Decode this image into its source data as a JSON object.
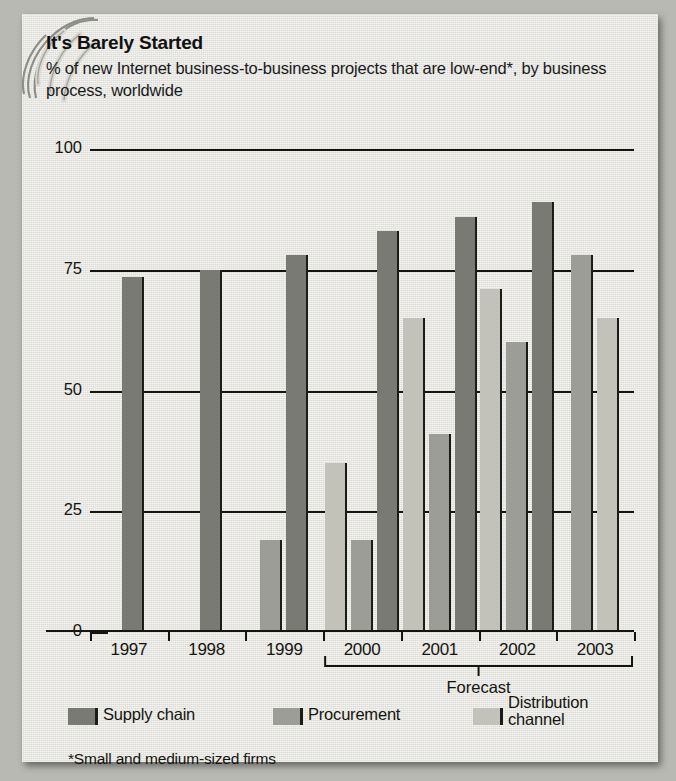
{
  "title": "It's Barely Started",
  "subtitle": "% of new Internet business-to-business projects that are low-end*, by business process, worldwide",
  "footnote": "*Small and medium-sized firms",
  "forecast_label": "Forecast",
  "legend": [
    {
      "name": "Supply chain",
      "color": "#7a7a75"
    },
    {
      "name": "Procurement",
      "color": "#9d9d97"
    },
    {
      "name": "Distribution channel",
      "color": "#c2c2bb"
    }
  ],
  "chart_data": {
    "type": "bar",
    "title": "It's Barely Started",
    "subtitle": "% of new Internet business-to-business projects that are low-end*, by business process, worldwide",
    "xlabel": "",
    "ylabel": "%",
    "ylim": [
      0,
      100
    ],
    "yticks": [
      0,
      25,
      50,
      75,
      100
    ],
    "grid": true,
    "legend_position": "bottom",
    "categories": [
      "1997",
      "1998",
      "1999",
      "2000",
      "2001",
      "2002",
      "2003"
    ],
    "series": [
      {
        "name": "Supply chain",
        "color": "#7a7a75",
        "values": [
          73.5,
          75,
          78,
          83,
          86,
          89,
          null
        ]
      },
      {
        "name": "Procurement",
        "color": "#9d9d97",
        "values": [
          null,
          null,
          19,
          19,
          41,
          60,
          78
        ]
      },
      {
        "name": "Distribution channel",
        "color": "#c2c2bb",
        "values": [
          null,
          null,
          null,
          35,
          65,
          71,
          65
        ]
      }
    ],
    "bars": [
      {
        "year": "1997",
        "series": "Supply chain",
        "value": 73.5
      },
      {
        "year": "1998",
        "series": "Supply chain",
        "value": 75
      },
      {
        "year": "1999",
        "series": "Procurement",
        "value": 19
      },
      {
        "year": "1999",
        "series": "Supply chain",
        "value": 78
      },
      {
        "year": "2000",
        "series": "Distribution channel",
        "value": 35
      },
      {
        "year": "2000",
        "series": "Procurement",
        "value": 19
      },
      {
        "year": "2000",
        "series": "Supply chain",
        "value": 83
      },
      {
        "year": "2001",
        "series": "Distribution channel",
        "value": 65
      },
      {
        "year": "2001",
        "series": "Procurement",
        "value": 41
      },
      {
        "year": "2001",
        "series": "Supply chain",
        "value": 86
      },
      {
        "year": "2002",
        "series": "Distribution channel",
        "value": 71
      },
      {
        "year": "2002",
        "series": "Procurement",
        "value": 60
      },
      {
        "year": "2002",
        "series": "Supply chain",
        "value": 89
      },
      {
        "year": "2003",
        "series": "Procurement",
        "value": 78
      },
      {
        "year": "2003",
        "series": "Distribution channel",
        "value": 65
      }
    ],
    "forecast_years": [
      "2000",
      "2001",
      "2002",
      "2003"
    ],
    "annotations": [
      "Forecast",
      "*Small and medium-sized firms"
    ]
  }
}
